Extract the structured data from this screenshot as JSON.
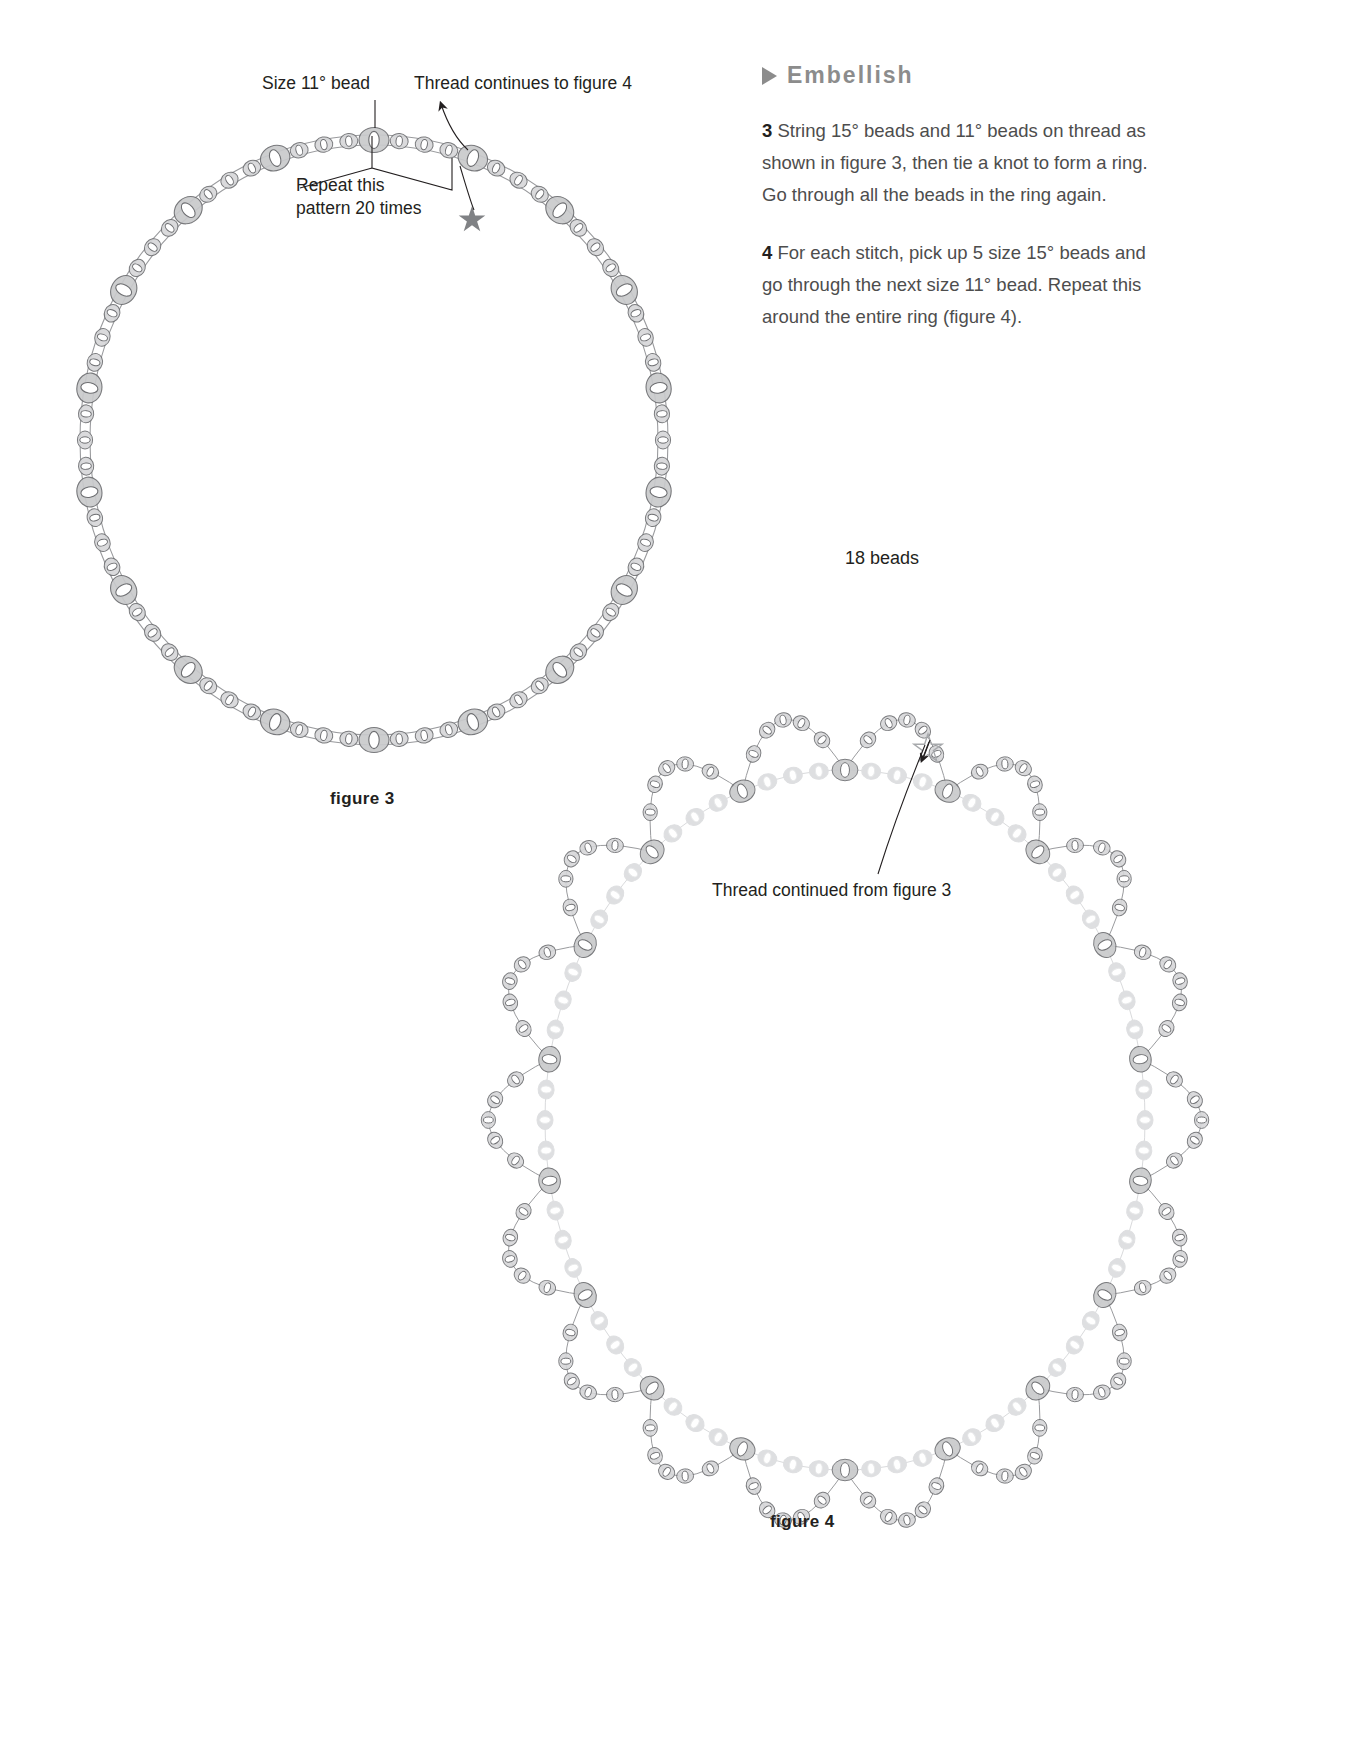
{
  "sidebar": null,
  "section": {
    "marker_icon": "triangle-right-icon",
    "title": "Embellish"
  },
  "steps": [
    {
      "number": "3",
      "text": "String 15° beads and 11° beads on thread as shown in figure 3, then tie a knot to form a ring. Go through all the beads in the ring again."
    },
    {
      "number": "4",
      "text": "For each stitch, pick up 5 size 15° beads and go through the next size 11° bead. Repeat this around the entire ring (figure 4)."
    }
  ],
  "annotations": {
    "bead_count": "18 beads",
    "size11_label": "Size 11° bead",
    "thread_to_fig4": "Thread continues to figure 4",
    "repeat_pattern_line1": "Repeat this",
    "repeat_pattern_line2": "pattern 20 times",
    "thread_from_fig3": "Thread continued from figure 3"
  },
  "figures": [
    {
      "caption": "figure 3",
      "kind": "bead-ring-base"
    },
    {
      "caption": "figure 4",
      "kind": "bead-ring-embellished"
    }
  ],
  "colors": {
    "bead_fill": "#c9cacc",
    "bead_stroke": "#6d6e71",
    "bead_light_fill": "#e2e3e4",
    "thread": "#9a9b9e",
    "heading": "#8c8c8c",
    "body_text": "#4d4d4d",
    "ink": "#231f20"
  }
}
